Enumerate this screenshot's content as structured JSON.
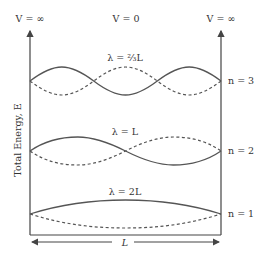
{
  "diagram": {
    "top_labels": {
      "left_wall": "V = ∞",
      "middle": "V = 0",
      "right_wall": "V = ∞"
    },
    "y_axis_label": "Total Energy, E",
    "x_span_label": "L",
    "levels": [
      {
        "n_label": "n = 3",
        "wavelength_label": "λ = ⅔L"
      },
      {
        "n_label": "n = 2",
        "wavelength_label": "λ = L"
      },
      {
        "n_label": "n = 1",
        "wavelength_label": "λ = 2L"
      }
    ],
    "colors": {
      "line": "#444444",
      "wave": "#555555",
      "text": "#333333"
    }
  }
}
